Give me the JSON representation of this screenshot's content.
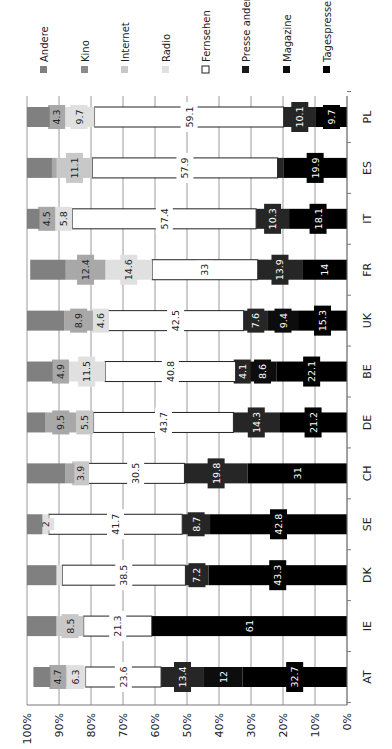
{
  "chart_data": {
    "type": "bar",
    "orientation": "stacked-100-percent, rotated 90deg clockwise",
    "title": "",
    "xlabel": "",
    "ylabel": "",
    "ylim": [
      0,
      100
    ],
    "y_ticks": [
      "0%",
      "10%",
      "20%",
      "30%",
      "40%",
      "50%",
      "60%",
      "70%",
      "80%",
      "90%",
      "100%"
    ],
    "grid": true,
    "legend_position": "top (rotated)",
    "categories": [
      "AT",
      "IE",
      "DK",
      "SE",
      "CH",
      "DE",
      "BE",
      "UK",
      "FR",
      "IT",
      "ES",
      "PL"
    ],
    "series": [
      {
        "name": "Tagespresse",
        "color": "#000000",
        "values": [
          32.7,
          61,
          43.3,
          42.8,
          31,
          21.2,
          22.1,
          15.3,
          14,
          18.1,
          19.9,
          9.7
        ],
        "labels": [
          "32.7",
          "61",
          "43.3",
          "42.8",
          "31",
          "21.2",
          "22.1",
          "15.3",
          "14",
          "18.1",
          "19.9",
          "9.7"
        ]
      },
      {
        "name": "Magazine",
        "color": "#0d0d0d",
        "values": [
          12,
          0,
          0,
          0,
          0,
          0,
          8.6,
          9.4,
          0,
          0,
          0,
          0
        ],
        "labels": [
          "12",
          "",
          "",
          "",
          "",
          "",
          "8.6",
          "9.4",
          "",
          "",
          "",
          ""
        ]
      },
      {
        "name": "Presse andere",
        "color": "#262626",
        "values": [
          13.4,
          0,
          7.2,
          8.7,
          19.8,
          14.3,
          4.1,
          7.6,
          13.9,
          10.3,
          1.8,
          10.1
        ],
        "labels": [
          "13.4",
          "",
          "7.2",
          "8.7",
          "19.8",
          "14.3",
          "4.1",
          "7.6",
          "13.9",
          "10.3",
          "",
          "10.1"
        ]
      },
      {
        "name": "Fernsehen",
        "color": "#ffffff",
        "values": [
          23.6,
          21.3,
          38.5,
          41.7,
          30.5,
          43.7,
          40.8,
          42.5,
          33,
          57.4,
          57.9,
          59.1
        ],
        "labels": [
          "23.6",
          "21.3",
          "38.5",
          "41.7",
          "30.5",
          "43.7",
          "40.8",
          "42.5",
          "33",
          "57.4",
          "57.9",
          "59.1"
        ]
      },
      {
        "name": "Radio",
        "color": "#e0e0e0",
        "values": [
          6.3,
          0,
          1.8,
          2,
          0,
          0,
          11.5,
          4.6,
          14.6,
          5.8,
          0,
          9.7
        ],
        "labels": [
          "6.3",
          "",
          "",
          "2",
          "",
          "",
          "11.5",
          "4.6",
          "14.6",
          "5.8",
          "",
          "9.7"
        ]
      },
      {
        "name": "Internet",
        "color": "#c8c8c8",
        "values": [
          0,
          8.5,
          0,
          0,
          3.9,
          5.5,
          0,
          0,
          0,
          0,
          11.1,
          0
        ],
        "labels": [
          "",
          "8.5",
          "",
          "",
          "3.9",
          "5.5",
          "",
          "",
          "",
          "",
          "11.1",
          ""
        ]
      },
      {
        "name": "Kino",
        "color": "#a8a8a8",
        "values": [
          4.7,
          0,
          0,
          0,
          2.8,
          9.5,
          4.9,
          8.9,
          12.4,
          4.5,
          1.5,
          4.3
        ],
        "labels": [
          "4.7",
          "",
          "",
          "",
          "",
          "9.5",
          "4.9",
          "8.9",
          "12.4",
          "4.5",
          "",
          "4.3"
        ]
      },
      {
        "name": "Andere",
        "color": "#808080",
        "values": [
          5.3,
          9.2,
          9.2,
          4.8,
          12,
          5.8,
          8,
          11.7,
          11.1,
          3.9,
          7.8,
          7.1
        ],
        "labels": [
          "",
          "",
          "",
          "",
          "",
          "",
          "",
          "",
          "",
          "",
          "",
          ""
        ]
      }
    ]
  },
  "legend": [
    {
      "name": "Andere",
      "color": "#808080",
      "outlined": false
    },
    {
      "name": "Kino",
      "color": "#8c8c8c",
      "outlined": false
    },
    {
      "name": "Internet",
      "color": "#c8c8c8",
      "outlined": false
    },
    {
      "name": "Radio",
      "color": "#e0e0e0",
      "outlined": false
    },
    {
      "name": "Fernsehen",
      "color": "#ffffff",
      "outlined": true
    },
    {
      "name": "Presse andere",
      "color": "#1a1a1a",
      "outlined": false
    },
    {
      "name": "Magazine",
      "color": "#0d0d0d",
      "outlined": false
    },
    {
      "name": "Tagespresse",
      "color": "#000000",
      "outlined": false
    }
  ]
}
